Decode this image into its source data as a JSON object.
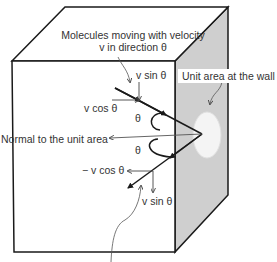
{
  "diagram": {
    "colors": {
      "edge": "#1a1a1a",
      "wall_face": "#cfcfcf",
      "unit_area": "#f4f4f4",
      "label_text": "#333333",
      "leader_line": "#555555"
    },
    "labels": {
      "molecules_line1": "Molecules moving with velocity",
      "molecules_line2": "v in direction θ",
      "unit_area": "Unit area at the wall",
      "normal": "Normal to the unit area",
      "v_sin_top": "v sin θ",
      "v_cos_top": "v cos θ",
      "theta_upper": "θ",
      "theta_lower": "θ",
      "neg_v_cos": "− v cos θ",
      "v_sin_bottom": "v sin θ"
    }
  }
}
